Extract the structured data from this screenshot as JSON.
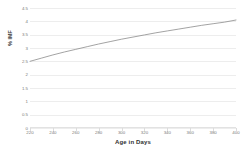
{
  "chart_data": {
    "type": "line",
    "title": "",
    "xlabel": "Age in Days",
    "ylabel": "% IMF",
    "xlim": [
      220,
      400
    ],
    "ylim": [
      0,
      4.5
    ],
    "grid": true,
    "legend": false,
    "legend_position": "none",
    "line_color": "#8c8c8c",
    "gridline_color": "#ededed",
    "background_color": "#ffffff",
    "x_ticks": [
      "220",
      "240",
      "260",
      "280",
      "300",
      "320",
      "340",
      "360",
      "380",
      "400"
    ],
    "y_ticks": [
      "0",
      "0.5",
      "1",
      "1.5",
      "2",
      "2.5",
      "3",
      "3.5",
      "4",
      "4.5"
    ],
    "series": [
      {
        "name": "% IMF",
        "x": [
          220,
          230,
          240,
          250,
          260,
          270,
          280,
          290,
          300,
          310,
          320,
          330,
          340,
          350,
          360,
          370,
          380,
          390,
          400
        ],
        "values": [
          2.5,
          2.62,
          2.74,
          2.85,
          2.95,
          3.05,
          3.15,
          3.24,
          3.33,
          3.41,
          3.49,
          3.57,
          3.64,
          3.71,
          3.78,
          3.85,
          3.91,
          3.97,
          4.05
        ]
      }
    ]
  }
}
